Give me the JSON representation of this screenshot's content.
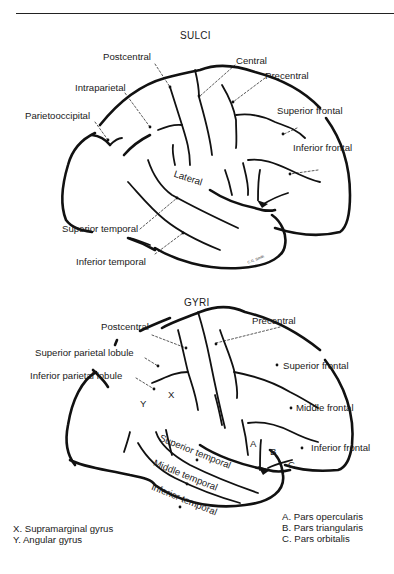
{
  "figure": {
    "panels": [
      {
        "title": "SULCI",
        "labels": {
          "postcentral": "Postcentral",
          "central": "Central",
          "precentral": "Precentral",
          "intraparietal": "Intraparietal",
          "parietooccipital": "Parietooccipital",
          "superior_frontal": "Superior frontal",
          "inferior_frontal": "Inferior frontal",
          "lateral": "Lateral",
          "superior_temporal": "Superior temporal",
          "inferior_temporal": "Inferior temporal"
        },
        "signature": "C.G. Smith"
      },
      {
        "title": "GYRI",
        "labels": {
          "postcentral": "Postcentral",
          "precentral": "Precentral",
          "superior_parietal_lobule": "Superior parietal lobule",
          "inferior_parietal_lobule": "Inferior parietal lobule",
          "superior_frontal": "Superior frontal",
          "middle_frontal": "Middle frontal",
          "inferior_frontal": "Inferior frontal",
          "superior_temporal": "Superior temporal",
          "middle_temporal": "Middle temporal",
          "inferior_temporal": "Inferior temporal",
          "x_marker": "X",
          "y_marker": "Y",
          "a_marker": "A",
          "b_marker": "B",
          "c_marker": "C"
        },
        "legend_left": [
          "X. Supramarginal gyrus",
          "Y. Angular gyrus"
        ],
        "legend_right": [
          "A. Pars opercularis",
          "B. Pars triangularis",
          "C. Pars orbitalis"
        ]
      }
    ],
    "colors": {
      "ink": "#1a1a1a",
      "background": "#ffffff"
    }
  }
}
